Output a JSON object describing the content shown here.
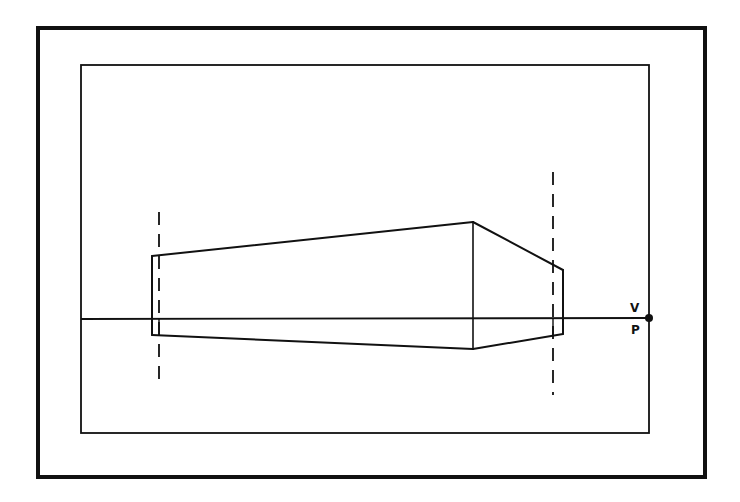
{
  "diagram": {
    "type": "perspective-sketch",
    "stroke_color": "#111111",
    "background": "#ffffff",
    "outer_frame": {
      "x": 38,
      "y": 28,
      "width": 667,
      "height": 449,
      "stroke_width": 4
    },
    "inner_frame": {
      "x": 81,
      "y": 65,
      "width": 568,
      "height": 368,
      "stroke_width": 1.8
    },
    "horizon_line": {
      "x1": 81,
      "y1": 319,
      "x2": 649,
      "y2": 318,
      "stroke_width": 1.8
    },
    "vanishing_point": {
      "x": 649,
      "y": 318,
      "r": 4
    },
    "labels": {
      "v": {
        "text": "V",
        "x": 630,
        "y": 312
      },
      "p": {
        "text": "P",
        "x": 631,
        "y": 334
      }
    },
    "box": {
      "left_edge": {
        "x1": 152,
        "y1": 256,
        "x2": 152,
        "y2": 335
      },
      "front_edge": {
        "x1": 473,
        "y1": 222,
        "x2": 473,
        "y2": 349
      },
      "right_edge": {
        "x1": 563,
        "y1": 270,
        "x2": 563,
        "y2": 334
      },
      "top_left": {
        "x1": 152,
        "y1": 256,
        "x2": 473,
        "y2": 222
      },
      "top_right": {
        "x1": 473,
        "y1": 222,
        "x2": 563,
        "y2": 270
      },
      "bottom_left": {
        "x1": 152,
        "y1": 335,
        "x2": 473,
        "y2": 349
      },
      "bottom_right": {
        "x1": 473,
        "y1": 349,
        "x2": 563,
        "y2": 334
      },
      "inner_left_stub": {
        "x1": 159,
        "y1": 319,
        "x2": 159,
        "y2": 335
      },
      "inner_right_stub": {
        "x1": 553,
        "y1": 319,
        "x2": 553,
        "y2": 336
      }
    },
    "dashed_guides": [
      {
        "name": "left-guide",
        "x1": 159,
        "y1": 212,
        "x2": 159,
        "y2": 385
      },
      {
        "name": "right-guide",
        "x1": 553,
        "y1": 172,
        "x2": 553,
        "y2": 395
      }
    ]
  }
}
